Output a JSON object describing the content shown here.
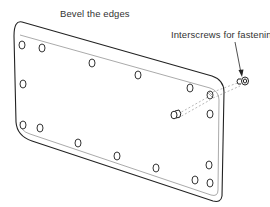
{
  "diagram": {
    "labels": {
      "bevel": "Bevel the edges",
      "interscrews": "Interscrews for fastening"
    },
    "hole_count": 18,
    "parts": [
      "plate",
      "bolt-holes",
      "interscrew-top",
      "interscrew-middle",
      "leader-arrow"
    ]
  }
}
